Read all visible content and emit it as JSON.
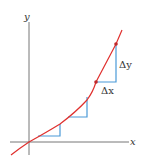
{
  "figure": {
    "axis_labels": {
      "x": "x",
      "y": "y"
    },
    "annotations": {
      "delta_y": "Δy",
      "delta_x": "Δx"
    },
    "colors": {
      "curve": "#e0302e",
      "steps": "#4a9ad8",
      "axes": "#777777",
      "points": "#c0282a",
      "text": "#333333"
    },
    "curve_points": [
      [
        11,
        155
      ],
      [
        20,
        148
      ],
      [
        29,
        142
      ],
      [
        45,
        133
      ],
      [
        60,
        124
      ],
      [
        75,
        112
      ],
      [
        87,
        100
      ],
      [
        96,
        82
      ],
      [
        106,
        63
      ],
      [
        116,
        44
      ],
      [
        122,
        30
      ]
    ],
    "steps": [
      {
        "start": [
          38,
          136
        ],
        "corner": [
          60,
          136
        ],
        "end": [
          60,
          124
        ]
      },
      {
        "start": [
          68,
          117
        ],
        "corner": [
          87,
          117
        ],
        "end": [
          87,
          97
        ]
      },
      {
        "start": [
          96,
          82
        ],
        "corner": [
          116,
          82
        ],
        "end": [
          116,
          44
        ]
      }
    ],
    "highlight_points": [
      [
        96,
        82
      ],
      [
        116,
        44
      ]
    ],
    "axes": {
      "origin": [
        29,
        142
      ],
      "x_range": [
        10,
        129
      ],
      "y_range": [
        22,
        155
      ]
    }
  }
}
